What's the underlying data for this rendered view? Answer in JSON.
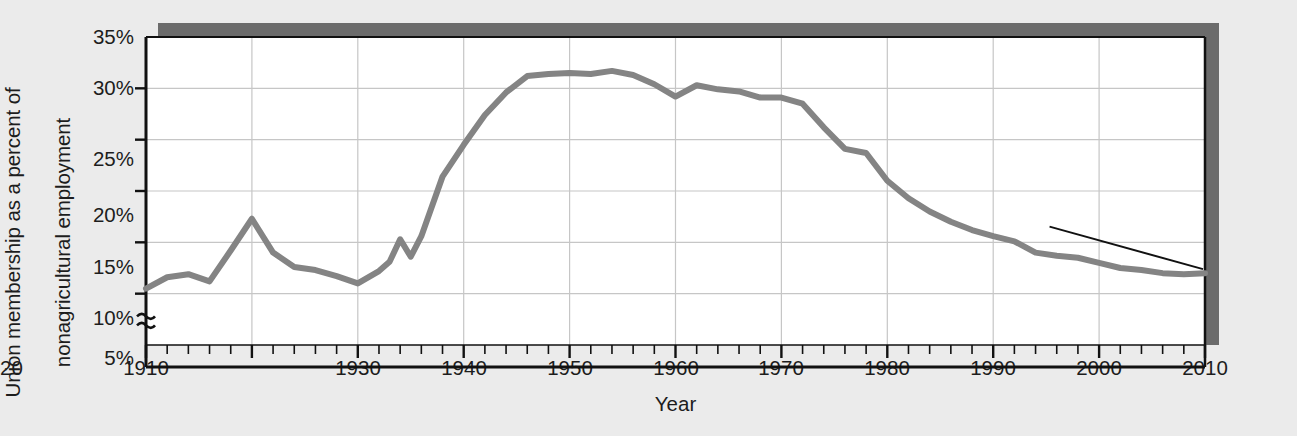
{
  "chart_data": {
    "type": "line",
    "title": "",
    "xlabel": "Year",
    "ylabel_line1": "Union membership as a percent of",
    "ylabel_line2": "nonagricultural employment",
    "xlim": [
      1910,
      2010
    ],
    "ylim": [
      5,
      35
    ],
    "y_axis_break": true,
    "y_break_symbol": "≈",
    "grid": true,
    "grid_x_values": [
      1920,
      1930,
      1940,
      1950,
      1960,
      1970,
      1980,
      1990,
      2000
    ],
    "grid_y_values": [
      10,
      15,
      20,
      25,
      30
    ],
    "legend": null,
    "x_major_ticks": [
      1910,
      1920,
      1930,
      1940,
      1950,
      1960,
      1970,
      1980,
      1990,
      2000,
      2010
    ],
    "x_minor_tick_step": 2,
    "x_tick_labels": [
      "1910",
      "1920",
      "1930",
      "1940",
      "1950",
      "1960",
      "1970",
      "1980",
      "1990",
      "2000",
      "2010"
    ],
    "y_tick_values": [
      5,
      10,
      15,
      20,
      25,
      30,
      35
    ],
    "y_tick_labels": [
      "5%",
      "10%",
      "15%",
      "20%",
      "25%",
      "30%",
      "35%"
    ],
    "line_color": "#848484",
    "line_width": 6,
    "annotations": [
      {
        "text": "12.0%",
        "x": 2010,
        "y": 12.0,
        "label_x": 1994,
        "label_y": 17.6
      }
    ],
    "series": [
      {
        "name": "Union membership as a percent of nonagricultural employment",
        "x": [
          1910,
          1912,
          1914,
          1916,
          1918,
          1920,
          1922,
          1924,
          1926,
          1928,
          1930,
          1932,
          1933,
          1934,
          1935,
          1936,
          1938,
          1940,
          1942,
          1944,
          1946,
          1948,
          1950,
          1952,
          1954,
          1956,
          1958,
          1960,
          1962,
          1964,
          1966,
          1968,
          1970,
          1972,
          1974,
          1976,
          1978,
          1980,
          1982,
          1984,
          1986,
          1988,
          1990,
          1992,
          1994,
          1996,
          1998,
          2000,
          2002,
          2004,
          2006,
          2008,
          2010
        ],
        "y": [
          10.5,
          11.6,
          11.9,
          11.2,
          14.2,
          17.3,
          14.0,
          12.6,
          12.3,
          11.7,
          11.0,
          12.2,
          13.1,
          15.3,
          13.6,
          15.6,
          21.4,
          24.5,
          27.4,
          29.6,
          31.2,
          31.4,
          31.5,
          31.4,
          31.7,
          31.3,
          30.4,
          29.2,
          30.3,
          29.9,
          29.7,
          29.1,
          29.1,
          28.5,
          26.2,
          24.1,
          23.7,
          21.0,
          19.3,
          18.0,
          17.0,
          16.2,
          15.6,
          15.1,
          14.0,
          13.7,
          13.5,
          13.0,
          12.5,
          12.3,
          12.0,
          11.9,
          12.0
        ]
      }
    ]
  },
  "plot": {
    "area_left": 146,
    "area_top": 37,
    "area_right": 1205,
    "area_bottom": 345,
    "background": "#ffffff",
    "shadow_color": "#6b6b6b",
    "axis_color": "#111111",
    "grid_color": "#c6c6c6",
    "page_background": "#ebebeb"
  }
}
